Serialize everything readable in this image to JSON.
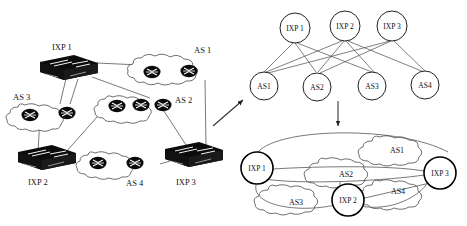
{
  "figure": {
    "panels": [
      {
        "id": "physical",
        "name": "physical-topology"
      },
      {
        "id": "bipartite",
        "name": "bipartite-graph"
      },
      {
        "id": "as-level",
        "name": "as-level-graph"
      }
    ]
  },
  "colors": {
    "ink": "#111111",
    "device_fill": "#000000",
    "cloud_stroke": "#444444",
    "line": "#555555",
    "background": "#ffffff"
  },
  "physical": {
    "ixps": [
      {
        "label": "IXP 1",
        "icon": "switch-icon"
      },
      {
        "label": "IXP 2",
        "icon": "switch-icon"
      },
      {
        "label": "IXP 3",
        "icon": "switch-icon"
      }
    ],
    "autonomous_systems": [
      {
        "label": "AS 1",
        "icon": "cloud-icon",
        "routers": 2
      },
      {
        "label": "AS 2",
        "icon": "cloud-icon",
        "routers": 3
      },
      {
        "label": "AS 3",
        "icon": "cloud-icon",
        "routers": 2
      },
      {
        "label": "AS 4",
        "icon": "cloud-icon",
        "routers": 2
      }
    ]
  },
  "bipartite": {
    "top_nodes": [
      "IXP 1",
      "IXP 2",
      "IXP 3"
    ],
    "bottom_nodes": [
      "AS1",
      "AS2",
      "AS3",
      "AS4"
    ],
    "edges": [
      [
        "IXP 1",
        "AS1"
      ],
      [
        "IXP 1",
        "AS2"
      ],
      [
        "IXP 1",
        "AS3"
      ],
      [
        "IXP 2",
        "AS1"
      ],
      [
        "IXP 2",
        "AS2"
      ],
      [
        "IXP 2",
        "AS3"
      ],
      [
        "IXP 2",
        "AS4"
      ],
      [
        "IXP 3",
        "AS1"
      ],
      [
        "IXP 3",
        "AS2"
      ],
      [
        "IXP 3",
        "AS4"
      ]
    ]
  },
  "as_level": {
    "ixp_nodes": [
      "IXP 1",
      "IXP 2",
      "IXP 3"
    ],
    "as_clouds": [
      "AS1",
      "AS2",
      "AS3",
      "AS4"
    ]
  },
  "arrows": [
    {
      "name": "arrow-to-bipartite",
      "direction": "up-right"
    },
    {
      "name": "arrow-to-as-level",
      "direction": "down"
    }
  ]
}
